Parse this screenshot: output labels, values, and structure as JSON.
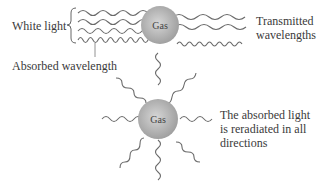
{
  "labels": {
    "white_light": "White light",
    "absorbed_wavelength": "Absorbed wavelength",
    "transmitted_line1": "Transmitted",
    "transmitted_line2": "wavelengths",
    "reradiated_line1": "The absorbed light",
    "reradiated_line2": "is reradiated in all",
    "reradiated_line3": "directions",
    "gas_top": "Gas",
    "gas_bottom": "Gas"
  },
  "colors": {
    "wave": "#6a6a6a",
    "gas_fill_center": "#d0d0d0",
    "gas_fill_edge": "#9a9a9a",
    "text": "#3a3a3a"
  }
}
